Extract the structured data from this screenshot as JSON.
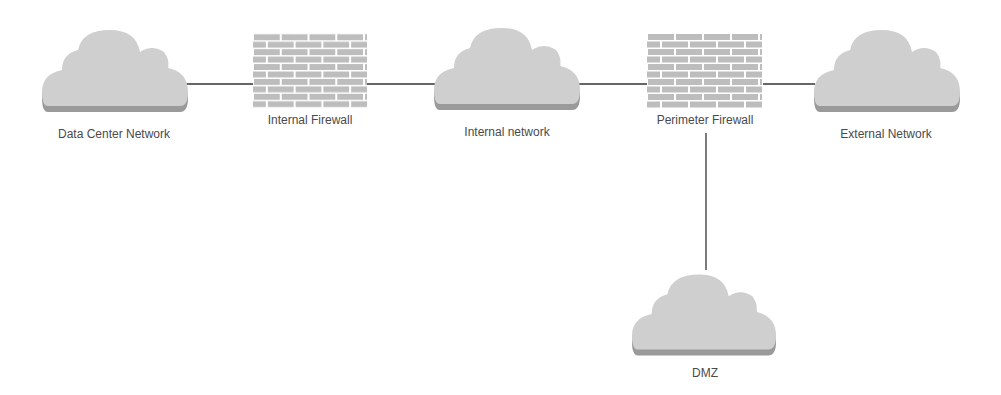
{
  "diagram": {
    "nodes": [
      {
        "id": "dc",
        "type": "cloud",
        "label": "Data Center Network"
      },
      {
        "id": "ifw",
        "type": "firewall",
        "label": "Internal Firewall"
      },
      {
        "id": "in",
        "type": "cloud",
        "label": "Internal network"
      },
      {
        "id": "pfw",
        "type": "firewall",
        "label": "Perimeter Firewall"
      },
      {
        "id": "ext",
        "type": "cloud",
        "label": "External Network"
      },
      {
        "id": "dmz",
        "type": "cloud",
        "label": "DMZ"
      }
    ],
    "edges": [
      {
        "from": "dc",
        "to": "ifw"
      },
      {
        "from": "ifw",
        "to": "in"
      },
      {
        "from": "in",
        "to": "pfw"
      },
      {
        "from": "pfw",
        "to": "ext"
      },
      {
        "from": "pfw",
        "to": "dmz"
      }
    ],
    "colors": {
      "cloud": "#cfcfcf",
      "cloud_shadow": "#9a9a9a",
      "brick": "#bdbdbd",
      "line": "#333333",
      "text": "#4a4a4a"
    }
  }
}
